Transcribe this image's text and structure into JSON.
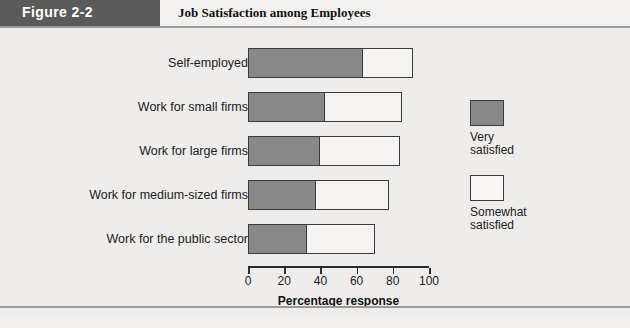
{
  "header": {
    "figure_tab": "Figure 2-2",
    "title": "Job Satisfaction among Employees"
  },
  "legend": {
    "items": [
      {
        "label_line1": "Very",
        "label_line2": "satisfied",
        "color": "#898989",
        "swatch_name": "legend-swatch-very-satisfied"
      },
      {
        "label_line1": "Somewhat",
        "label_line2": "satisfied",
        "color": "#f7f6f4",
        "swatch_name": "legend-swatch-somewhat-satisfied"
      }
    ]
  },
  "chart_data": {
    "type": "bar",
    "orientation": "horizontal",
    "stacked": true,
    "title": "Job Satisfaction among Employees",
    "xlabel": "Percentage response",
    "ylabel": "",
    "xlim": [
      0,
      100
    ],
    "xticks": [
      0,
      20,
      40,
      60,
      80,
      100
    ],
    "xticklabels": [
      "0",
      "20",
      "40",
      "60",
      "80",
      "100"
    ],
    "grid": false,
    "legend_position": "right",
    "categories": [
      "Self-employed",
      "Work for small firms",
      "Work for large firms",
      "Work for medium-sized firms",
      "Work for the public sector"
    ],
    "series": [
      {
        "name": "Very satisfied",
        "color": "#898989",
        "values": [
          64,
          43,
          40,
          38,
          33
        ]
      },
      {
        "name": "Somewhat satisfied",
        "color": "#f4f3f1",
        "values": [
          27,
          42,
          44,
          40,
          37
        ]
      }
    ],
    "totals": [
      91,
      85,
      84,
      78,
      70
    ]
  }
}
